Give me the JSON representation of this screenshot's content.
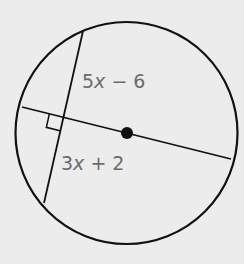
{
  "diagram": {
    "background": "#ececec",
    "stroke_color": "#111111",
    "label_color": "#6b6b6b",
    "circle": {
      "cx": 126.5,
      "cy": 133,
      "r": 111
    },
    "center_point": {
      "x": 127,
      "y": 133,
      "r": 6
    },
    "diameter": {
      "x1": 22,
      "y1": 107,
      "x2": 231,
      "y2": 159
    },
    "chord": {
      "x1": 83,
      "y1": 31,
      "x2": 44,
      "y2": 203
    },
    "intersection": {
      "x": 63,
      "y": 117
    },
    "right_angle_marker": true,
    "labels": {
      "upper_segment": {
        "coef": "5",
        "var": "x",
        "rest": " − 6",
        "x": 82,
        "y": 88
      },
      "lower_segment": {
        "coef": "3",
        "var": "x",
        "rest": " + 2",
        "x": 61,
        "y": 170
      }
    }
  }
}
